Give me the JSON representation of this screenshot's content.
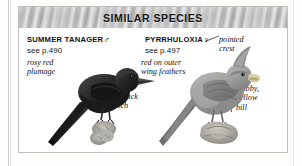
{
  "panel": {
    "header_title": "SIMILAR SPECIES"
  },
  "species": [
    {
      "name": "SUMMER TANAGER",
      "sex_symbol": "♂",
      "sex": "male",
      "page_reference": "see p.490",
      "annotations": [
        {
          "key": "rosy-red-plumage",
          "text": "rosy red\nplumage"
        },
        {
          "key": "no-black-patch",
          "text": "no black\npatch"
        }
      ]
    },
    {
      "name": "PYRRHULOXIA",
      "sex_symbol": "♀",
      "sex": "female",
      "page_reference": "see p.497",
      "annotations": [
        {
          "key": "pointed-crest",
          "text": "pointed\ncrest"
        },
        {
          "key": "red-on-outer-wing-feathers",
          "text": "red on outer\nwing feathers"
        },
        {
          "key": "stubby-yellow-bill",
          "text": "stubby,\nyellow\nbill"
        }
      ]
    }
  ],
  "colors": {
    "header_band": "#c2c2c2",
    "panel_border": "#bfbfbf",
    "panel_background": "#ffffff",
    "page_background": "#fdfdfc",
    "text": "#131313",
    "tanager_body": "#2b2b2b",
    "pyrrhuloxia_body": "#9a9a9a"
  }
}
